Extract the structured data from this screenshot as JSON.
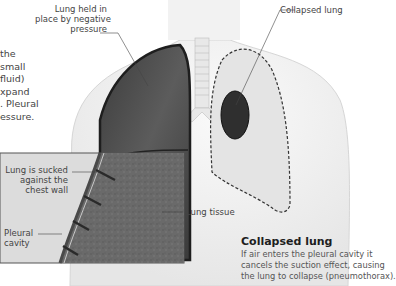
{
  "diagram": {
    "intro_fragment": [
      "the",
      "small",
      "fluid)",
      "xpand",
      ". Pleural",
      "essure."
    ],
    "labels": {
      "held_lung": [
        "Lung held in",
        "place by negative",
        "pressure"
      ],
      "collapsed_lung": "Collapsed lung",
      "sucked": [
        "Lung is sucked",
        "against the",
        "chest wall"
      ],
      "pleural_cavity": [
        "Pleural",
        "cavity"
      ],
      "lung_tissue": "Lung tissue"
    },
    "caption": {
      "title": "Collapsed lung",
      "lines": [
        "If air enters the pleural cavity it",
        "cancels the suction effect, causing",
        "the lung to collapse (pneumothorax)."
      ]
    },
    "colors": {
      "body": "#f4f4f4",
      "lung_dark": "#4a4a4a",
      "tissue": "#6b6b6b",
      "inset_bg": "#dcdcdc",
      "dashed_outline": "#333333"
    }
  }
}
